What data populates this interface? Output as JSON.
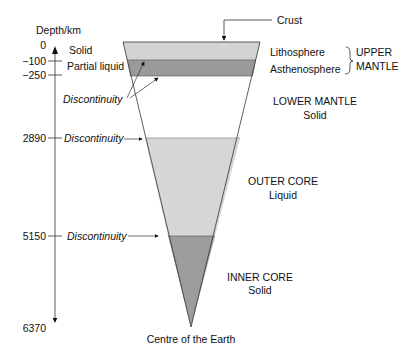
{
  "axis": {
    "label": "Depth/km",
    "ticks": [
      {
        "value": "0",
        "y": 45
      },
      {
        "value": "−100",
        "y": 61
      },
      {
        "value": "−250",
        "y": 75
      },
      {
        "value": "2890",
        "y": 138
      },
      {
        "value": "5150",
        "y": 236
      },
      {
        "value": "6370",
        "y": 328
      }
    ]
  },
  "layers": [
    {
      "name": "Lithosphere",
      "state": "Solid",
      "color": "#d3d3d3",
      "y_top": 42,
      "y_bottom": 60
    },
    {
      "name": "Asthenosphere",
      "state": "Partial liquid",
      "color": "#9a9a9a",
      "y_top": 60,
      "y_bottom": 76
    },
    {
      "name": "LOWER MANTLE",
      "state": "Solid",
      "color": "#ffffff",
      "y_top": 76,
      "y_bottom": 138
    },
    {
      "name": "OUTER CORE",
      "state": "Liquid",
      "color": "#d6d6d6",
      "y_top": 138,
      "y_bottom": 236
    },
    {
      "name": "INNER CORE",
      "state": "Solid",
      "color": "#9c9c9c",
      "y_top": 236,
      "y_bottom": 327
    }
  ],
  "labels": {
    "crust": "Crust",
    "lithosphere": "Lithosphere",
    "asthenosphere": "Asthenosphere",
    "upper_mantle_line1": "UPPER",
    "upper_mantle_line2": "MANTLE",
    "lower_mantle": "LOWER MANTLE",
    "lower_mantle_state": "Solid",
    "outer_core": "OUTER CORE",
    "outer_core_state": "Liquid",
    "inner_core": "INNER CORE",
    "inner_core_state": "Solid",
    "solid": "Solid",
    "partial_liquid": "Partial liquid",
    "discontinuity": "Discontinuity",
    "centre": "Centre of the Earth"
  }
}
